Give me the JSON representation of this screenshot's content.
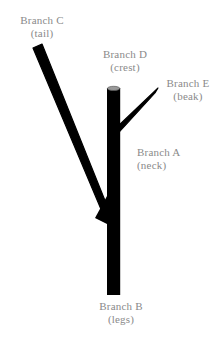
{
  "figure": {
    "background_color": "#ffffff",
    "branch_color": "#000000",
    "cut_end_color": "#9a9a9a",
    "label_color": "#8a8a8a"
  },
  "labels": {
    "branch_c": {
      "name": "Branch C",
      "part": "(tail)"
    },
    "branch_d": {
      "name": "Branch D",
      "part": "(crest)"
    },
    "branch_e": {
      "name": "Branch E",
      "part": "(beak)"
    },
    "branch_a": {
      "name": "Branch A",
      "part": "(neck)"
    },
    "branch_b": {
      "name": "Branch B",
      "part": "(legs)"
    }
  },
  "geometry": {
    "trunk": {
      "x1": 113.5,
      "y1": 88,
      "x2": 113.5,
      "y2": 294,
      "width": 13
    },
    "branch_e": {
      "x1": 115,
      "y1": 133,
      "x2": 157,
      "y2": 90,
      "width": 6
    },
    "branch_c": {
      "x1": 110,
      "y1": 214,
      "x2": 36,
      "y2": 47,
      "width": 9
    },
    "cut_cap": {
      "cx": 113.5,
      "cy": 88,
      "rx": 6.5,
      "ry": 2.2
    }
  }
}
